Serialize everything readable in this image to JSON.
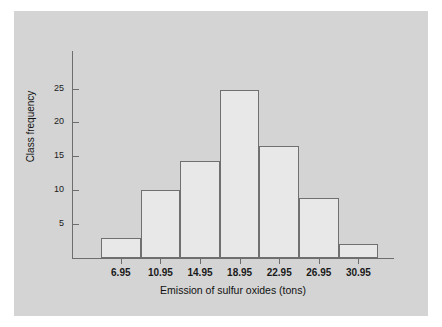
{
  "figure": {
    "background_color": "#d4d4d4",
    "page_color": "#ffffff",
    "bar_fill": "#e8e8e8",
    "bar_edge": "#707070",
    "axis_color": "#6d6d6d"
  },
  "chart_data": {
    "type": "bar",
    "title": "",
    "subtitle": "",
    "xlabel": "Emission of sulfur oxides (tons)",
    "ylabel": "Class frequency",
    "categories": [
      "6.95",
      "10.95",
      "14.95",
      "18.95",
      "22.95",
      "26.95",
      "30.95"
    ],
    "values": [
      3,
      10,
      14.3,
      24.8,
      16.5,
      8.8,
      2
    ],
    "ylim": [
      0,
      27.5
    ],
    "yticks": [
      5,
      10,
      15,
      20,
      25
    ],
    "ytick_labels": [
      "5",
      "10",
      "15",
      "20",
      "25"
    ],
    "xtick_labels": [
      "6.95",
      "10.95",
      "14.95",
      "18.95",
      "22.95",
      "26.95",
      "30.95"
    ],
    "grid": false,
    "legend": null,
    "annotations": []
  }
}
